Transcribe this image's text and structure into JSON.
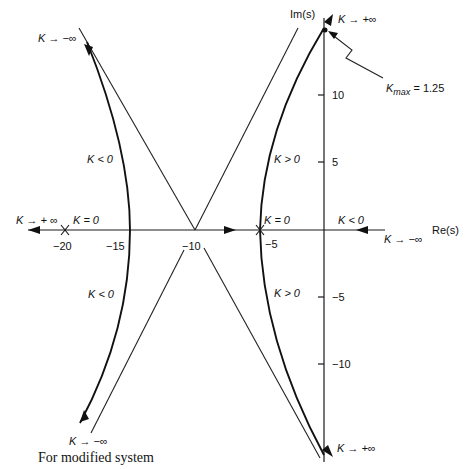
{
  "figure": {
    "caption": "For modified system",
    "axes": {
      "x_label": "Re(s)",
      "y_label": "Im(s)",
      "x_ticks": [
        "−20",
        "−15",
        "−10",
        "−5"
      ],
      "y_ticks_pos": [
        "10",
        "5"
      ],
      "y_ticks_neg": [
        "−5",
        "−10"
      ]
    },
    "annotations": {
      "top_left_limit": "K → −∞",
      "top_right_limit": "K → +∞",
      "kmax": "K",
      "kmax_sub": "max",
      "kmax_value": " = 1.25",
      "left_upper_region": "K < 0",
      "left_lower_region": "K < 0",
      "right_upper_region": "K > 0",
      "right_lower_region": "K > 0",
      "left_axis_limit": "K → + ∞",
      "pole_left_k0": "K = 0",
      "pole_right_k0": "K = 0",
      "right_axis_region": "K < 0",
      "right_axis_limit": "K → −∞",
      "bottom_left_limit": "K → −∞",
      "bottom_right_limit": "K → +∞"
    },
    "key_points": {
      "poles": [
        -20,
        -5
      ],
      "asymptote_centroid": -10,
      "left_branch_axis_crossing": -15,
      "kmax_imag_crossing": 14,
      "kmax": 1.25
    }
  }
}
